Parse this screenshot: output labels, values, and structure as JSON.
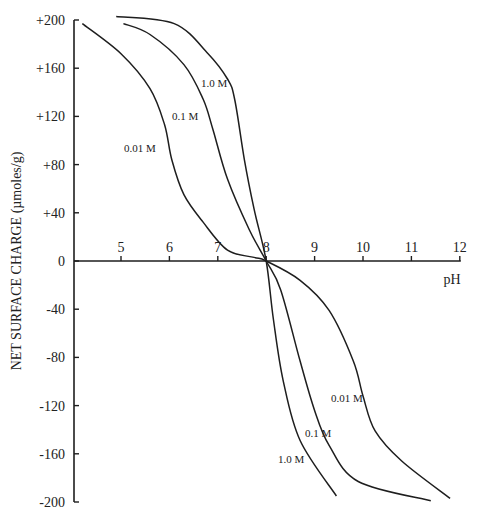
{
  "chart_data": {
    "type": "line",
    "title": "",
    "xlabel": "pH",
    "ylabel": "NET  SURFACE  CHARGE  (µmoles/g)",
    "xlim": [
      4,
      12
    ],
    "ylim": [
      -200,
      200
    ],
    "x_ticks": [
      "5",
      "6",
      "7",
      "8",
      "9",
      "10",
      "11",
      "12"
    ],
    "y_ticks": [
      "+200",
      "+160",
      "+120",
      "+80",
      "+40",
      "0",
      "-40",
      "-80",
      "-120",
      "-160",
      "-200"
    ],
    "grid": false,
    "legend": "inline curve labels",
    "series": [
      {
        "name": "0.01 M",
        "x": [
          4.2,
          5.0,
          5.6,
          5.9,
          6.05,
          6.3,
          6.7,
          7.2,
          7.75,
          8.0,
          8.7,
          9.3,
          9.8,
          10.0,
          10.25,
          10.8,
          11.8
        ],
        "y": [
          197,
          172,
          143,
          113,
          84,
          55,
          32,
          9,
          3,
          0,
          -16,
          -41,
          -83,
          -112,
          -141,
          -166,
          -197
        ]
      },
      {
        "name": "0.1 M",
        "x": [
          5.05,
          5.6,
          6.3,
          6.7,
          6.9,
          7.2,
          7.65,
          8.0,
          8.3,
          8.7,
          9.0,
          9.3,
          9.9,
          11.4
        ],
        "y": [
          197,
          188,
          163,
          134,
          109,
          68,
          26,
          0,
          -24,
          -83,
          -124,
          -153,
          -183,
          -199
        ]
      },
      {
        "name": "1.0 M",
        "x": [
          4.9,
          6.1,
          6.8,
          7.2,
          7.35,
          7.55,
          7.75,
          8.0,
          8.15,
          8.35,
          8.7,
          9.45
        ],
        "y": [
          203,
          197,
          172,
          151,
          134,
          84,
          43,
          0,
          -49,
          -99,
          -149,
          -195
        ]
      }
    ],
    "curve_labels": [
      {
        "text": "1.0 M",
        "upper_x": 7.1,
        "upper_y": 145,
        "lower_x": 8.2,
        "lower_y": -165
      },
      {
        "text": "0.1 M",
        "upper_x": 6.5,
        "upper_y": 120,
        "lower_x": 8.8,
        "lower_y": -145
      },
      {
        "text": "0.01 M",
        "upper_x": 5.6,
        "upper_y": 93,
        "lower_x": 9.6,
        "lower_y": -115
      }
    ],
    "annotations": [
      "point of zero charge at pH 8"
    ]
  }
}
